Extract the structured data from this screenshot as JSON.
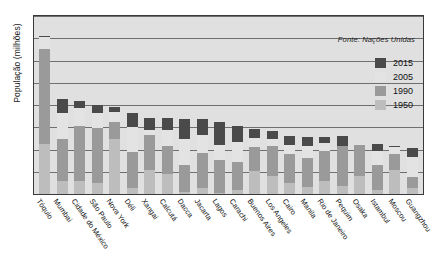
{
  "chart_data": {
    "type": "bar",
    "stacked": true,
    "title": "",
    "xlabel": "",
    "ylabel": "População (milhões)",
    "ylim": [
      0,
      40
    ],
    "yticks": [
      0,
      5,
      10,
      15,
      20,
      25,
      30,
      35,
      40
    ],
    "grid": true,
    "legend_position": "top-right",
    "source_note": "Fonte: Nações Unidas",
    "series": [
      {
        "name": "1950",
        "color": "#bdbdbd"
      },
      {
        "name": "1990",
        "color": "#9a9a9a"
      },
      {
        "name": "2005",
        "color": "#e3e3e3"
      },
      {
        "name": "2015",
        "color": "#4a4a4a"
      }
    ],
    "categories": [
      "Tóquio",
      "Mumbai",
      "Cidade do México",
      "São Paulo",
      "Nova York",
      "Déli",
      "Xangai",
      "Calcutá",
      "Dacca",
      "Jacarta",
      "Lagos",
      "Carachi",
      "Buenos Aires",
      "Los Angeles",
      "Cairo",
      "Manila",
      "Rio de Janeiro",
      "Pequim",
      "Osaka",
      "Istambul",
      "Moscou",
      "Guangzhou"
    ],
    "cumulative_values": {
      "1950": [
        11.3,
        2.9,
        2.9,
        2.4,
        12.3,
        1.4,
        5.3,
        4.4,
        0.4,
        1.4,
        0.3,
        1.0,
        5.1,
        4.0,
        2.4,
        1.5,
        2.9,
        1.7,
        4.1,
        1.0,
        5.4,
        1.4
      ],
      "1990": [
        32.5,
        12.3,
        15.3,
        14.8,
        16.1,
        9.4,
        13.3,
        10.9,
        6.6,
        9.3,
        7.7,
        7.1,
        10.5,
        10.9,
        9.1,
        8.0,
        9.6,
        10.9,
        11.0,
        6.6,
        9.0,
        3.9
      ],
      "2005": [
        35.2,
        18.2,
        19.4,
        18.3,
        18.5,
        15.0,
        14.5,
        14.3,
        12.4,
        13.2,
        11.1,
        11.6,
        12.6,
        12.3,
        11.1,
        10.7,
        11.5,
        10.7,
        11.3,
        9.7,
        10.6,
        8.4
      ],
      "2015": [
        35.5,
        21.4,
        20.9,
        20.0,
        19.5,
        18.3,
        17.2,
        17.0,
        16.8,
        16.8,
        16.1,
        15.2,
        14.6,
        14.1,
        13.1,
        12.9,
        12.8,
        12.9,
        11.3,
        11.2,
        10.9,
        10.4
      ]
    }
  },
  "legend": {
    "items": [
      {
        "label": "2015",
        "color": "#4a4a4a"
      },
      {
        "label": "2005",
        "color": "#e3e3e3"
      },
      {
        "label": "1990",
        "color": "#9a9a9a"
      },
      {
        "label": "1950",
        "color": "#bdbdbd"
      }
    ]
  }
}
